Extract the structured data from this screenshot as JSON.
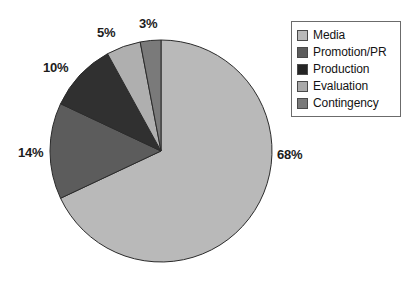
{
  "chart_data": {
    "type": "pie",
    "title": "",
    "subtitle": "",
    "xlabel": "",
    "ylabel": "",
    "grid": false,
    "legend_position": "top-right",
    "start_angle_deg": 0,
    "direction": "clockwise",
    "center": {
      "x": 161,
      "y": 151
    },
    "radius": 111,
    "categories": [
      "Media",
      "Promotion/PR",
      "Production",
      "Evaluation",
      "Contingency"
    ],
    "values": [
      68,
      14,
      10,
      5,
      3
    ],
    "value_unit": "%",
    "slices": [
      {
        "label": "Media",
        "value": 68,
        "value_text": "68%",
        "color": "#b9b9b9",
        "stroke": "#2b2b2b",
        "start_deg": 0,
        "end_deg": 244.8,
        "label_pos": {
          "x": 277,
          "y": 147
        }
      },
      {
        "label": "Promotion/PR",
        "value": 14,
        "value_text": "14%",
        "color": "#5c5c5c",
        "stroke": "#2b2b2b",
        "start_deg": 244.8,
        "end_deg": 295.2,
        "label_pos": {
          "x": 18,
          "y": 145
        }
      },
      {
        "label": "Production",
        "value": 10,
        "value_text": "10%",
        "color": "#303030",
        "stroke": "#2b2b2b",
        "start_deg": 295.2,
        "end_deg": 331.2,
        "label_pos": {
          "x": 43,
          "y": 60
        }
      },
      {
        "label": "Evaluation",
        "value": 5,
        "value_text": "5%",
        "color": "#afafaf",
        "stroke": "#2b2b2b",
        "start_deg": 331.2,
        "end_deg": 349.2,
        "label_pos": {
          "x": 97,
          "y": 25
        }
      },
      {
        "label": "Contingency",
        "value": 3,
        "value_text": "3%",
        "color": "#7a7a7a",
        "stroke": "#2b2b2b",
        "start_deg": 349.2,
        "end_deg": 360.0,
        "label_pos": {
          "x": 139,
          "y": 16
        }
      }
    ]
  },
  "legend": {
    "border_color": "#6b6b6b",
    "items": [
      {
        "label": "Media",
        "color": "#b9b9b9"
      },
      {
        "label": "Promotion/PR",
        "color": "#5c5c5c"
      },
      {
        "label": "Production",
        "color": "#252525"
      },
      {
        "label": "Evaluation",
        "color": "#a9a9a9"
      },
      {
        "label": "Contingency",
        "color": "#7a7a7a"
      }
    ]
  },
  "labels": {
    "media": "68%",
    "promotion": "14%",
    "production": "10%",
    "evaluation": "5%",
    "contingency": "3%"
  },
  "colors": {
    "background": "#ffffff",
    "text": "#1c1c1c",
    "slice_outline": "#2b2b2b"
  }
}
